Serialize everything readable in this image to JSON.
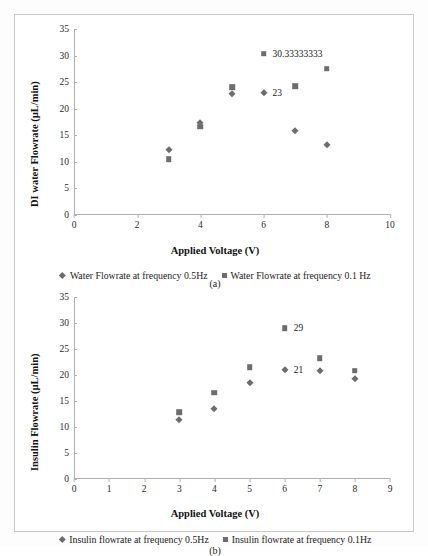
{
  "figure": {
    "marker_color": "#6d6d6d",
    "axis_color": "#b0b0b0",
    "background": "#ffffff"
  },
  "chart_data": [
    {
      "panel": "a",
      "type": "scatter",
      "title": "",
      "xlabel": "Applied Voltage (V)",
      "ylabel": "DI water Flowrate (µL/min)",
      "xlim": [
        0,
        10
      ],
      "ylim": [
        0,
        35
      ],
      "xticks": [
        0,
        2,
        4,
        6,
        8,
        10
      ],
      "yticks": [
        0,
        5,
        10,
        15,
        20,
        25,
        30,
        35
      ],
      "grid": false,
      "legend_position": "bottom",
      "caption": "(a)",
      "series": [
        {
          "name": "Water Flowrate at frequency 0.5Hz",
          "marker": "diamond",
          "color": "#6d6d6d",
          "x": [
            3,
            4,
            5,
            6,
            7,
            8
          ],
          "y": [
            12.3,
            17.3,
            22.7,
            23.0,
            15.9,
            13.2
          ]
        },
        {
          "name": "Water Flowrate at  frequency  0.1 Hz",
          "marker": "square",
          "color": "#6d6d6d",
          "x": [
            3,
            4,
            5,
            6,
            7,
            8
          ],
          "y": [
            10.5,
            16.6,
            24.1,
            30.33333333,
            24.2,
            27.5
          ]
        }
      ],
      "annotations": [
        {
          "text": "30.33333333",
          "x": 6,
          "y": 30.33333333,
          "series": "0.1Hz",
          "marker": "square"
        },
        {
          "text": "23",
          "x": 6,
          "y": 23.0,
          "series": "0.5Hz",
          "marker": "diamond"
        }
      ]
    },
    {
      "panel": "b",
      "type": "scatter",
      "title": "",
      "xlabel": "Applied Voltage (V)",
      "ylabel": "Insulin Flowrate (µL/min)",
      "xlim": [
        0,
        9
      ],
      "ylim": [
        0,
        35
      ],
      "xticks": [
        0,
        1,
        2,
        3,
        4,
        5,
        6,
        7,
        8,
        9
      ],
      "yticks": [
        0,
        5,
        10,
        15,
        20,
        25,
        30,
        35
      ],
      "grid": false,
      "legend_position": "bottom",
      "caption": "(b)",
      "series": [
        {
          "name": "Insulin flowrate at frequency 0.5Hz",
          "marker": "diamond",
          "color": "#6d6d6d",
          "x": [
            3,
            4,
            5,
            6,
            7,
            8
          ],
          "y": [
            11.4,
            13.4,
            18.5,
            21.0,
            20.7,
            19.3
          ]
        },
        {
          "name": "Insulin flowrate at frequency 0.1Hz",
          "marker": "square",
          "color": "#6d6d6d",
          "x": [
            3,
            4,
            5,
            6,
            7,
            8
          ],
          "y": [
            12.8,
            16.6,
            21.5,
            29.0,
            23.2,
            20.8
          ]
        }
      ],
      "annotations": [
        {
          "text": "29",
          "x": 6,
          "y": 29.0,
          "series": "0.1Hz",
          "marker": "square"
        },
        {
          "text": "21",
          "x": 6,
          "y": 21.0,
          "series": "0.5Hz",
          "marker": "diamond"
        }
      ]
    }
  ]
}
